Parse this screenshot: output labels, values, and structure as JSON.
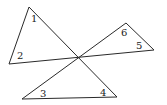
{
  "diagram": {
    "type": "geometry",
    "intersection_point": [
      78,
      57
    ],
    "vertices": {
      "A": [
        29,
        7
      ],
      "B": [
        9,
        64
      ],
      "C": [
        126,
        23
      ],
      "D": [
        154,
        50
      ],
      "E": [
        22,
        99
      ],
      "F": [
        117,
        97
      ],
      "O": [
        78,
        57
      ]
    },
    "triangles": [
      {
        "name": "left",
        "vertices": [
          "A",
          "B",
          "O"
        ],
        "angles": [
          "1",
          "2"
        ]
      },
      {
        "name": "right",
        "vertices": [
          "C",
          "D",
          "O"
        ],
        "angles": [
          "6",
          "5"
        ]
      },
      {
        "name": "bottom",
        "vertices": [
          "E",
          "F",
          "O"
        ],
        "angles": [
          "3",
          "4"
        ]
      }
    ],
    "labels": [
      {
        "text": "1",
        "x": 31,
        "y": 22
      },
      {
        "text": "2",
        "x": 17,
        "y": 59
      },
      {
        "text": "3",
        "x": 40,
        "y": 97
      },
      {
        "text": "4",
        "x": 100,
        "y": 96
      },
      {
        "text": "5",
        "x": 136,
        "y": 49
      },
      {
        "text": "6",
        "x": 121,
        "y": 36
      }
    ]
  }
}
